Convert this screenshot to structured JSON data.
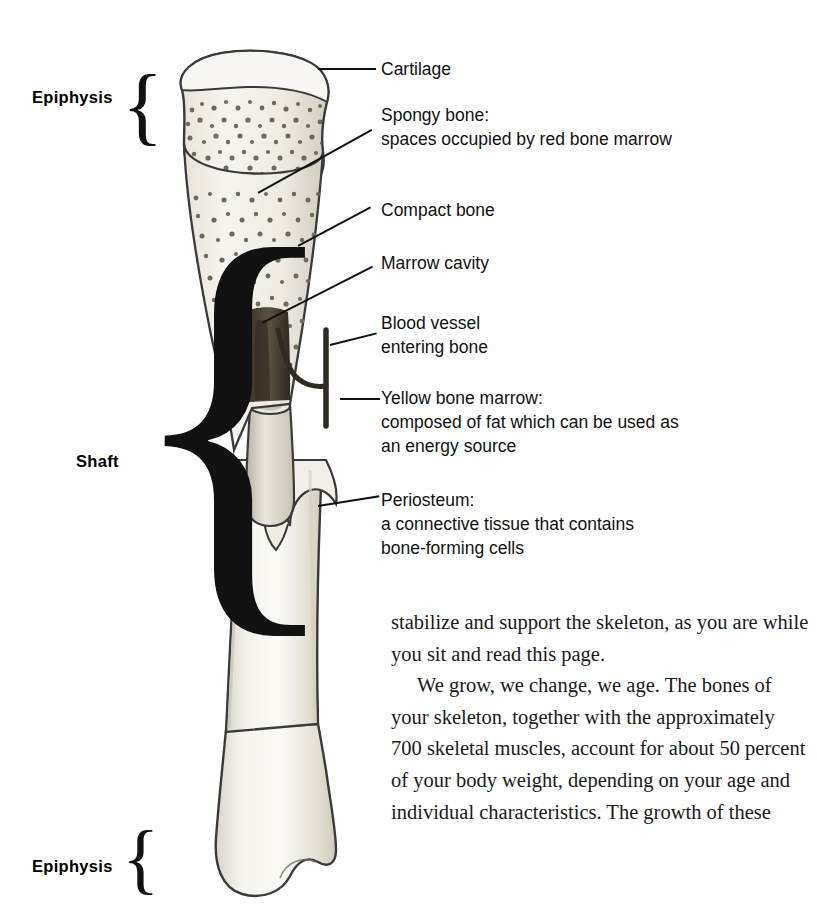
{
  "figure": {
    "name": "long-bone-cross-section-diagram",
    "colors": {
      "bone_outline": "#3a3a3a",
      "bone_fill_light": "#f4f2ee",
      "bone_fill_mid": "#e4e0d6",
      "spongy_speckle": "#6d6a5c",
      "marrow_dark": "#4a4236",
      "marrow_cavity": "#cfcabd",
      "text": "#111111"
    }
  },
  "side_labels": [
    {
      "text": "Epiphysis",
      "brace": "{"
    },
    {
      "text": "Shaft",
      "brace": "{"
    },
    {
      "text": "Epiphysis",
      "brace": "{"
    }
  ],
  "callouts": [
    {
      "id": "cartilage",
      "text": "Cartilage"
    },
    {
      "id": "spongy-bone",
      "text": "Spongy bone:\nspaces occupied by red bone marrow"
    },
    {
      "id": "compact-bone",
      "text": "Compact bone"
    },
    {
      "id": "marrow-cavity",
      "text": "Marrow cavity"
    },
    {
      "id": "blood-vessel",
      "text": "Blood vessel\nentering bone"
    },
    {
      "id": "yellow-marrow",
      "text": "Yellow bone marrow:\ncomposed of fat which can be used as\nan energy source"
    },
    {
      "id": "periosteum",
      "text": "Periosteum:\na connective tissue that contains\nbone-forming cells"
    }
  ],
  "body_copy": {
    "paragraphs": [
      {
        "indent": false,
        "text": "stabilize and support the skeleton, as you are while you sit and read this page."
      },
      {
        "indent": true,
        "text": "We grow, we change, we age. The bones of your skeleton, together with the approximately 700 skeletal muscles, account for about 50 percent of your body weight, depending on your age and individual characteristics. The growth of these"
      }
    ]
  }
}
